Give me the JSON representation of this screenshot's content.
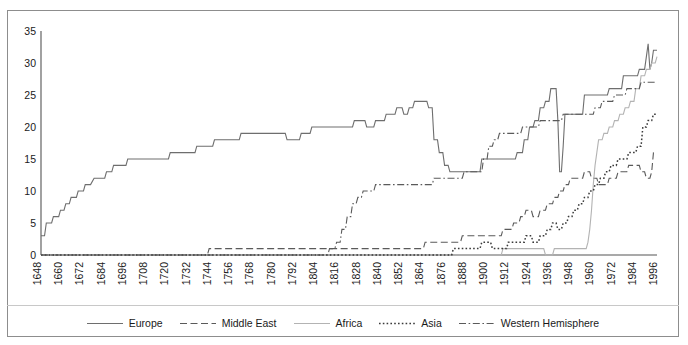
{
  "chart_data": {
    "type": "line",
    "title": "",
    "xlabel": "",
    "ylabel": "",
    "xlim": [
      1648,
      1996
    ],
    "ylim": [
      0,
      35
    ],
    "yticks": [
      0,
      5,
      10,
      15,
      20,
      25,
      30,
      35
    ],
    "xticks": [
      1648,
      1660,
      1672,
      1684,
      1696,
      1708,
      1720,
      1732,
      1744,
      1756,
      1768,
      1780,
      1792,
      1804,
      1816,
      1828,
      1840,
      1852,
      1864,
      1876,
      1888,
      1900,
      1912,
      1924,
      1936,
      1948,
      1960,
      1972,
      1984,
      1996
    ],
    "grid": false,
    "legend_position": "bottom",
    "series": [
      {
        "name": "Europe",
        "style": "solid",
        "color": "#6e6e6e",
        "points": [
          [
            1648,
            3
          ],
          [
            1650,
            3
          ],
          [
            1651,
            5
          ],
          [
            1654,
            5
          ],
          [
            1655,
            6
          ],
          [
            1658,
            6
          ],
          [
            1659,
            7
          ],
          [
            1661,
            7
          ],
          [
            1662,
            8
          ],
          [
            1664,
            8
          ],
          [
            1665,
            9
          ],
          [
            1668,
            9
          ],
          [
            1669,
            10
          ],
          [
            1672,
            10
          ],
          [
            1673,
            11
          ],
          [
            1676,
            11
          ],
          [
            1678,
            12
          ],
          [
            1684,
            12
          ],
          [
            1685,
            13
          ],
          [
            1688,
            13
          ],
          [
            1689,
            14
          ],
          [
            1696,
            14
          ],
          [
            1697,
            15
          ],
          [
            1720,
            15
          ],
          [
            1721,
            16
          ],
          [
            1735,
            16
          ],
          [
            1736,
            17
          ],
          [
            1745,
            17
          ],
          [
            1746,
            18
          ],
          [
            1760,
            18
          ],
          [
            1761,
            19
          ],
          [
            1786,
            19
          ],
          [
            1787,
            18
          ],
          [
            1794,
            18
          ],
          [
            1795,
            19
          ],
          [
            1800,
            19
          ],
          [
            1801,
            20
          ],
          [
            1824,
            20
          ],
          [
            1825,
            21
          ],
          [
            1831,
            21
          ],
          [
            1832,
            20
          ],
          [
            1836,
            20
          ],
          [
            1837,
            21
          ],
          [
            1842,
            21
          ],
          [
            1843,
            22
          ],
          [
            1848,
            22
          ],
          [
            1849,
            23
          ],
          [
            1852,
            23
          ],
          [
            1853,
            22
          ],
          [
            1855,
            22
          ],
          [
            1856,
            23
          ],
          [
            1858,
            23
          ],
          [
            1859,
            24
          ],
          [
            1866,
            24
          ],
          [
            1867,
            23
          ],
          [
            1869,
            23
          ],
          [
            1870,
            18
          ],
          [
            1872,
            18
          ],
          [
            1873,
            16
          ],
          [
            1875,
            16
          ],
          [
            1876,
            14
          ],
          [
            1878,
            14
          ],
          [
            1879,
            13
          ],
          [
            1896,
            13
          ],
          [
            1897,
            15
          ],
          [
            1916,
            15
          ],
          [
            1917,
            16
          ],
          [
            1920,
            16
          ],
          [
            1921,
            18
          ],
          [
            1923,
            18
          ],
          [
            1924,
            20
          ],
          [
            1926,
            20
          ],
          [
            1927,
            21
          ],
          [
            1929,
            21
          ],
          [
            1930,
            23
          ],
          [
            1932,
            23
          ],
          [
            1933,
            24
          ],
          [
            1935,
            24
          ],
          [
            1936,
            26
          ],
          [
            1939,
            26
          ],
          [
            1940,
            21
          ],
          [
            1941,
            13
          ],
          [
            1942,
            13
          ],
          [
            1943,
            17
          ],
          [
            1944,
            22
          ],
          [
            1945,
            22
          ],
          [
            1946,
            22
          ],
          [
            1947,
            22
          ],
          [
            1948,
            22
          ],
          [
            1954,
            22
          ],
          [
            1955,
            25
          ],
          [
            1968,
            25
          ],
          [
            1969,
            26
          ],
          [
            1976,
            26
          ],
          [
            1977,
            28
          ],
          [
            1985,
            28
          ],
          [
            1986,
            29
          ],
          [
            1989,
            29
          ],
          [
            1990,
            31
          ],
          [
            1991,
            33
          ],
          [
            1992,
            29
          ],
          [
            1993,
            30
          ],
          [
            1994,
            32
          ],
          [
            1996,
            32
          ]
        ]
      },
      {
        "name": "Middle East",
        "style": "dashed",
        "color": "#5a5a5a",
        "points": [
          [
            1648,
            0
          ],
          [
            1742,
            0
          ],
          [
            1743,
            1
          ],
          [
            1864,
            1
          ],
          [
            1865,
            2
          ],
          [
            1885,
            2
          ],
          [
            1886,
            3
          ],
          [
            1899,
            3
          ],
          [
            1900,
            3
          ],
          [
            1908,
            3
          ],
          [
            1909,
            4
          ],
          [
            1914,
            4
          ],
          [
            1915,
            5
          ],
          [
            1918,
            5
          ],
          [
            1919,
            6
          ],
          [
            1921,
            6
          ],
          [
            1922,
            7
          ],
          [
            1925,
            7
          ],
          [
            1926,
            6
          ],
          [
            1929,
            6
          ],
          [
            1930,
            7
          ],
          [
            1933,
            7
          ],
          [
            1934,
            8
          ],
          [
            1937,
            8
          ],
          [
            1938,
            9
          ],
          [
            1940,
            9
          ],
          [
            1941,
            10
          ],
          [
            1943,
            10
          ],
          [
            1944,
            11
          ],
          [
            1946,
            11
          ],
          [
            1947,
            12
          ],
          [
            1954,
            12
          ],
          [
            1955,
            13
          ],
          [
            1958,
            13
          ],
          [
            1959,
            12
          ],
          [
            1962,
            12
          ],
          [
            1963,
            11
          ],
          [
            1968,
            11
          ],
          [
            1969,
            12
          ],
          [
            1973,
            12
          ],
          [
            1974,
            13
          ],
          [
            1979,
            13
          ],
          [
            1980,
            14
          ],
          [
            1986,
            14
          ],
          [
            1987,
            13
          ],
          [
            1989,
            13
          ],
          [
            1990,
            12
          ],
          [
            1992,
            12
          ],
          [
            1993,
            13
          ],
          [
            1994,
            16
          ],
          [
            1996,
            16
          ]
        ]
      },
      {
        "name": "Africa",
        "style": "solid-light",
        "color": "#b3b3b3",
        "points": [
          [
            1648,
            0
          ],
          [
            1908,
            0
          ],
          [
            1909,
            1
          ],
          [
            1932,
            1
          ],
          [
            1933,
            0
          ],
          [
            1937,
            0
          ],
          [
            1938,
            1
          ],
          [
            1956,
            1
          ],
          [
            1957,
            2
          ],
          [
            1958,
            4
          ],
          [
            1959,
            7
          ],
          [
            1960,
            11
          ],
          [
            1961,
            14
          ],
          [
            1962,
            16
          ],
          [
            1963,
            18
          ],
          [
            1965,
            18
          ],
          [
            1966,
            19
          ],
          [
            1968,
            19
          ],
          [
            1969,
            20
          ],
          [
            1971,
            20
          ],
          [
            1972,
            21
          ],
          [
            1974,
            21
          ],
          [
            1975,
            22
          ],
          [
            1977,
            22
          ],
          [
            1978,
            23
          ],
          [
            1980,
            23
          ],
          [
            1981,
            24
          ],
          [
            1983,
            24
          ],
          [
            1984,
            26
          ],
          [
            1986,
            26
          ],
          [
            1987,
            28
          ],
          [
            1989,
            28
          ],
          [
            1990,
            29
          ],
          [
            1992,
            29
          ],
          [
            1993,
            30
          ],
          [
            1995,
            30
          ],
          [
            1996,
            31
          ]
        ]
      },
      {
        "name": "Asia",
        "style": "dotted",
        "color": "#3a3a3a",
        "points": [
          [
            1648,
            0
          ],
          [
            1880,
            0
          ],
          [
            1881,
            1
          ],
          [
            1896,
            1
          ],
          [
            1897,
            2
          ],
          [
            1902,
            2
          ],
          [
            1903,
            1
          ],
          [
            1911,
            1
          ],
          [
            1912,
            2
          ],
          [
            1921,
            2
          ],
          [
            1922,
            3
          ],
          [
            1925,
            3
          ],
          [
            1926,
            2
          ],
          [
            1929,
            2
          ],
          [
            1930,
            3
          ],
          [
            1933,
            3
          ],
          [
            1934,
            4
          ],
          [
            1936,
            4
          ],
          [
            1937,
            5
          ],
          [
            1939,
            5
          ],
          [
            1940,
            4
          ],
          [
            1942,
            4
          ],
          [
            1943,
            5
          ],
          [
            1945,
            5
          ],
          [
            1946,
            6
          ],
          [
            1948,
            6
          ],
          [
            1949,
            7
          ],
          [
            1951,
            7
          ],
          [
            1952,
            8
          ],
          [
            1954,
            8
          ],
          [
            1955,
            9
          ],
          [
            1957,
            9
          ],
          [
            1958,
            10
          ],
          [
            1960,
            10
          ],
          [
            1961,
            11
          ],
          [
            1963,
            11
          ],
          [
            1964,
            12
          ],
          [
            1966,
            12
          ],
          [
            1967,
            13
          ],
          [
            1969,
            13
          ],
          [
            1970,
            14
          ],
          [
            1973,
            14
          ],
          [
            1974,
            15
          ],
          [
            1979,
            15
          ],
          [
            1980,
            16
          ],
          [
            1984,
            16
          ],
          [
            1985,
            17
          ],
          [
            1987,
            17
          ],
          [
            1988,
            20
          ],
          [
            1990,
            20
          ],
          [
            1991,
            21
          ],
          [
            1993,
            21
          ],
          [
            1994,
            22
          ],
          [
            1996,
            22
          ]
        ]
      },
      {
        "name": "Western Hemisphere",
        "style": "dashdot",
        "color": "#5a5a5a",
        "points": [
          [
            1648,
            0
          ],
          [
            1810,
            0
          ],
          [
            1811,
            1
          ],
          [
            1814,
            1
          ],
          [
            1815,
            2
          ],
          [
            1817,
            2
          ],
          [
            1818,
            4
          ],
          [
            1820,
            4
          ],
          [
            1821,
            6
          ],
          [
            1823,
            6
          ],
          [
            1824,
            8
          ],
          [
            1826,
            8
          ],
          [
            1827,
            9
          ],
          [
            1829,
            9
          ],
          [
            1830,
            10
          ],
          [
            1836,
            10
          ],
          [
            1837,
            11
          ],
          [
            1862,
            11
          ],
          [
            1863,
            11
          ],
          [
            1869,
            11
          ],
          [
            1870,
            12
          ],
          [
            1886,
            12
          ],
          [
            1887,
            13
          ],
          [
            1897,
            13
          ],
          [
            1898,
            15
          ],
          [
            1900,
            15
          ],
          [
            1901,
            17
          ],
          [
            1903,
            17
          ],
          [
            1904,
            18
          ],
          [
            1906,
            18
          ],
          [
            1907,
            19
          ],
          [
            1919,
            19
          ],
          [
            1920,
            20
          ],
          [
            1929,
            20
          ],
          [
            1930,
            21
          ],
          [
            1942,
            21
          ],
          [
            1943,
            22
          ],
          [
            1960,
            22
          ],
          [
            1961,
            23
          ],
          [
            1964,
            23
          ],
          [
            1965,
            24
          ],
          [
            1971,
            24
          ],
          [
            1972,
            25
          ],
          [
            1978,
            25
          ],
          [
            1979,
            26
          ],
          [
            1986,
            26
          ],
          [
            1987,
            27
          ],
          [
            1996,
            27
          ]
        ]
      }
    ]
  },
  "legend": {
    "items": [
      {
        "label": "Europe",
        "style": "solid",
        "color": "#6e6e6e"
      },
      {
        "label": "Middle East",
        "style": "dashed",
        "color": "#5a5a5a"
      },
      {
        "label": "Africa",
        "style": "solid-light",
        "color": "#b3b3b3"
      },
      {
        "label": "Asia",
        "style": "dotted",
        "color": "#3a3a3a"
      },
      {
        "label": "Western Hemisphere",
        "style": "dashdot",
        "color": "#5a5a5a"
      }
    ]
  },
  "axes": {
    "y_tick_labels": [
      "35",
      "30",
      "25",
      "20",
      "15",
      "10",
      "5",
      "0"
    ],
    "x_tick_labels": [
      "1648",
      "1660",
      "1672",
      "1684",
      "1696",
      "1708",
      "1720",
      "1732",
      "1744",
      "1756",
      "1768",
      "1780",
      "1792",
      "1804",
      "1816",
      "1828",
      "1840",
      "1852",
      "1864",
      "1876",
      "1888",
      "1900",
      "1912",
      "1924",
      "1936",
      "1948",
      "1960",
      "1972",
      "1984",
      "1996"
    ],
    "axis_color": "#555555",
    "frame_color": "#8d8d8d"
  }
}
